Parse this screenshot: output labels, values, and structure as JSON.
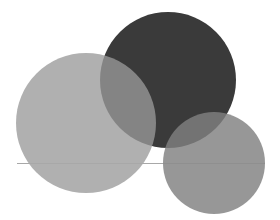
{
  "figure": {
    "background_color": "#ffffff",
    "width": 280,
    "height": 220
  },
  "chart_data": {
    "type": "scatter",
    "subtitle": "",
    "xlabel": "",
    "ylabel": "",
    "xlim": [
      0,
      280
    ],
    "ylim": [
      0,
      220
    ],
    "grid": false,
    "legend": "none",
    "axes_visible": false,
    "tick_labels_x": [],
    "tick_labels_y": [],
    "annotations": [],
    "background_color": "#ffffff",
    "marker_shape": "circle",
    "series": [
      {
        "name": "dark-circle",
        "cx": 168,
        "cy": 80,
        "r": 68,
        "color": "#3a3a3a",
        "opacity": 1,
        "draw_order": 1
      },
      {
        "name": "light-gray-circle",
        "cx": 86,
        "cy": 123,
        "r": 70,
        "color": "#9a9a9a",
        "opacity": 0.78,
        "draw_order": 2
      },
      {
        "name": "medium-gray-circle",
        "cx": 214,
        "cy": 163,
        "r": 51,
        "color": "#808080",
        "opacity": 0.82,
        "draw_order": 3
      }
    ],
    "overlap_colors": {
      "dark_and_light_gray": "#6a6a6a",
      "dark_and_medium_gray": "#989898",
      "light_gray_and_medium_gray": "#8c8c8c"
    },
    "seam_lines": [
      {
        "name": "seam-lower-left",
        "x1": 17,
        "y1": 163,
        "x2": 163,
        "y2": 163,
        "color": "#a8a8a8"
      },
      {
        "name": "seam-lower-right",
        "x1": 163,
        "y1": 163,
        "x2": 265,
        "y2": 163,
        "color": "#8f8f8f"
      }
    ]
  }
}
